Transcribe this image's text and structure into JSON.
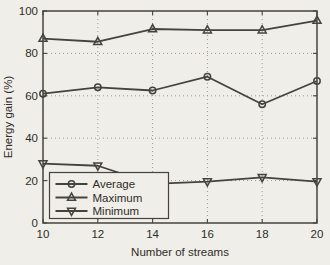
{
  "figure": {
    "background_color": "#f0eee8",
    "line_color": "#45443c",
    "grid_color": "#9c9a90",
    "text_color": "#2e2d27"
  },
  "chart_data": {
    "type": "line",
    "title": "",
    "xlabel": "Number of streams",
    "ylabel": "Energy gain (%)",
    "x": [
      10,
      12,
      14,
      16,
      18,
      20
    ],
    "xlim": [
      10,
      20
    ],
    "ylim": [
      0,
      100
    ],
    "x_ticks": [
      10,
      12,
      14,
      16,
      18,
      20
    ],
    "y_ticks": [
      0,
      20,
      40,
      60,
      80,
      100
    ],
    "grid": true,
    "grid_style": "dotted",
    "legend_position": "lower-left",
    "series": [
      {
        "name": "Average",
        "marker": "circle",
        "values": [
          61,
          64,
          62.5,
          69,
          56,
          67
        ]
      },
      {
        "name": "Maximum",
        "marker": "triangle-up",
        "values": [
          87,
          85.5,
          91.5,
          91,
          91,
          95.5
        ]
      },
      {
        "name": "Minimum",
        "marker": "triangle-down",
        "values": [
          28,
          27,
          18.5,
          19.5,
          21.5,
          19.5
        ]
      }
    ]
  }
}
